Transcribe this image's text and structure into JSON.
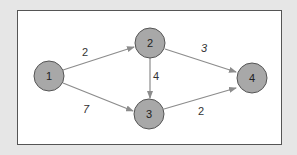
{
  "colors": {
    "background": "#e6e6e6",
    "frame_fill": "#ffffff",
    "frame_border": "#555555",
    "node_fill": "#a8a8a8",
    "node_stroke": "#555555",
    "edge_color": "#8c8c8c",
    "text": "#222222"
  },
  "nodes": [
    {
      "id": "1",
      "label": "1",
      "cx": 49,
      "cy": 76,
      "r": 15
    },
    {
      "id": "2",
      "label": "2",
      "cx": 150,
      "cy": 43,
      "r": 15
    },
    {
      "id": "3",
      "label": "3",
      "cx": 149,
      "cy": 114,
      "r": 15
    },
    {
      "id": "4",
      "label": "4",
      "cx": 252,
      "cy": 78,
      "r": 15
    }
  ],
  "edges": [
    {
      "from": "1",
      "to": "2",
      "weight": "2"
    },
    {
      "from": "1",
      "to": "3",
      "weight": "7"
    },
    {
      "from": "2",
      "to": "3",
      "weight": "4"
    },
    {
      "from": "2",
      "to": "4",
      "weight": "3"
    },
    {
      "from": "3",
      "to": "4",
      "weight": "2"
    }
  ]
}
